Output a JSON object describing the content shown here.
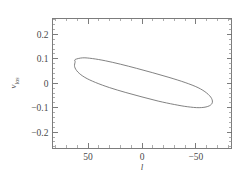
{
  "chart_data": {
    "type": "line",
    "title": "",
    "subtitle": "",
    "xlabel": "l",
    "xlabel_style": "italic",
    "ylabel": "v",
    "ylabel_subscript": "los",
    "xlim": [
      83,
      -83
    ],
    "ylim": [
      -0.265,
      0.265
    ],
    "x_axis_inverted": true,
    "grid": false,
    "legend": null,
    "x_ticks": [
      50,
      0,
      -50
    ],
    "x_tick_labels": [
      "50",
      "0",
      "-50"
    ],
    "x_minor_tick_step": 10,
    "y_ticks": [
      0.2,
      0.1,
      0,
      -0.1,
      -0.2
    ],
    "y_tick_labels": [
      "0.2",
      "0.1",
      "0",
      "-0.1",
      "-0.2"
    ],
    "y_minor_tick_step": 0.02,
    "tick_direction": "in",
    "series": [
      {
        "name": "ellipse-contour",
        "type": "closed-curve",
        "stroke_color": "#6b6b6b",
        "points": [
          [
            62.0,
            0.097
          ],
          [
            55.0,
            0.104
          ],
          [
            46.0,
            0.101
          ],
          [
            34.0,
            0.092
          ],
          [
            20.0,
            0.078
          ],
          [
            5.0,
            0.061
          ],
          [
            -10.0,
            0.043
          ],
          [
            -25.0,
            0.024
          ],
          [
            -40.0,
            0.003
          ],
          [
            -52.0,
            -0.018
          ],
          [
            -60.0,
            -0.04
          ],
          [
            -64.5,
            -0.062
          ],
          [
            -65.0,
            -0.082
          ],
          [
            -61.0,
            -0.095
          ],
          [
            -53.0,
            -0.1
          ],
          [
            -42.0,
            -0.096
          ],
          [
            -30.0,
            -0.087
          ],
          [
            -15.0,
            -0.073
          ],
          [
            0.0,
            -0.056
          ],
          [
            15.0,
            -0.038
          ],
          [
            30.0,
            -0.018
          ],
          [
            43.0,
            0.003
          ],
          [
            53.0,
            0.024
          ],
          [
            59.5,
            0.046
          ],
          [
            62.5,
            0.068
          ],
          [
            62.0,
            0.088
          ],
          [
            62.0,
            0.097
          ]
        ]
      }
    ]
  },
  "figure": {
    "background_color": "#ffffff",
    "frame_color": "#6e6e6e",
    "text_color": "#4a4a4a"
  }
}
